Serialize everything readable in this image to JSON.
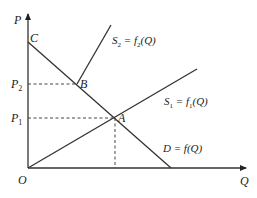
{
  "diagram": {
    "type": "supply-demand",
    "axes": {
      "y_label": "P",
      "x_label": "Q",
      "origin_label": "O"
    },
    "price_levels": [
      {
        "label": "P",
        "sub": "2",
        "point": "B"
      },
      {
        "label": "P",
        "sub": "1",
        "point": "A"
      }
    ],
    "points": {
      "C": "C",
      "B": "B",
      "A": "A"
    },
    "curves": {
      "s2": {
        "main": "S",
        "sub": "2",
        "eq": " = f",
        "fsub": "2",
        "arg": "(Q)"
      },
      "s1": {
        "main": "S",
        "sub": "1",
        "eq": " = f",
        "fsub": "1",
        "arg": "(Q)"
      },
      "demand": {
        "text": "D = f(Q)"
      }
    },
    "colors": {
      "line": "#333333",
      "background": "#ffffff"
    }
  }
}
